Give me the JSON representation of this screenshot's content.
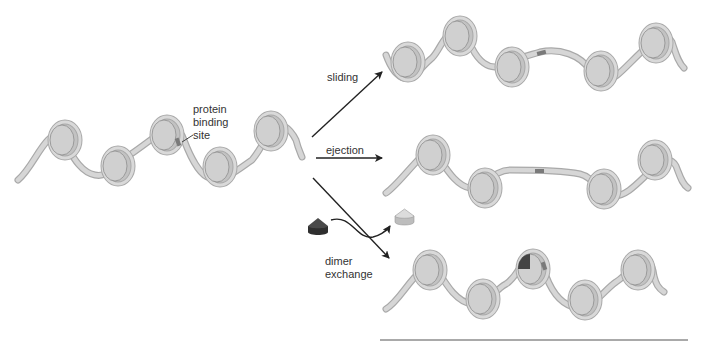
{
  "diagram": {
    "colors": {
      "dna_outline": "#a9a9a9",
      "dna_fill": "#d6d6d6",
      "histone_face": "#d2d2d2",
      "histone_rim": "#b8b8b8",
      "binding_site": "#7a7a7a",
      "dimer_dark": "#3c3c3c",
      "dimer_light": "#cfcfcf",
      "arrow": "#222222",
      "text": "#333333"
    },
    "start_fiber": {
      "nucleosome_count": 5,
      "annotation": {
        "line1": "protein",
        "line2": "binding",
        "line3": "site"
      }
    },
    "pathways": [
      {
        "id": "sliding",
        "label": "sliding",
        "nucleosome_count": 5
      },
      {
        "id": "ejection",
        "label": "ejection",
        "nucleosome_count": 4
      },
      {
        "id": "dimer-exchange",
        "label_line1": "dimer",
        "label_line2": "exchange",
        "nucleosome_count": 5
      }
    ]
  }
}
